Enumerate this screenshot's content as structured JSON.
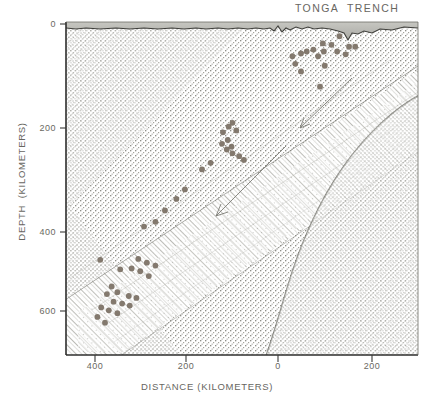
{
  "figure": {
    "title": "TONGA  TRENCH",
    "width": 430,
    "height": 404,
    "kind": "geological-cross-section"
  },
  "axes": {
    "x_label": "DISTANCE (KILOMETERS)",
    "y_label": "DEPTH  (KILOMETERS)",
    "x_ticks": [
      "400",
      "200",
      "0",
      "200"
    ],
    "y_ticks": [
      "0",
      "200",
      "400",
      "600"
    ]
  },
  "colors": {
    "ink": "#3a3a38",
    "label": "#67665f",
    "hypocenter": "#7a6f63",
    "water": "#b9b9b4",
    "stipple": "#8c8c86",
    "slab": "#9a9a94"
  },
  "chart_data": {
    "type": "scatter",
    "title": "TONGA  TRENCH",
    "xlabel": "DISTANCE (KILOMETERS)",
    "ylabel": "DEPTH  (KILOMETERS)",
    "xlim": [
      500,
      -240
    ],
    "ylim": [
      0,
      700
    ],
    "y_inverted": true,
    "grid": false,
    "legend": null,
    "x_tick_values": [
      400,
      200,
      0,
      -200
    ],
    "x_tick_labels": [
      "400",
      "200",
      "0",
      "200"
    ],
    "y_tick_values": [
      0,
      200,
      400,
      600
    ],
    "y_tick_labels": [
      "0",
      "200",
      "400",
      "600"
    ],
    "series": [
      {
        "name": "earthquake hypocenters",
        "marker": "filled-circle",
        "points": [
          {
            "x": -75,
            "y": 30
          },
          {
            "x": -58,
            "y": 48
          },
          {
            "x": -95,
            "y": 52
          },
          {
            "x": -108,
            "y": 52
          },
          {
            "x": -40,
            "y": 45
          },
          {
            "x": -42,
            "y": 62
          },
          {
            "x": -70,
            "y": 62
          },
          {
            "x": -88,
            "y": 68
          },
          {
            "x": -20,
            "y": 58
          },
          {
            "x": -6,
            "y": 62
          },
          {
            "x": -30,
            "y": 72
          },
          {
            "x": 6,
            "y": 66
          },
          {
            "x": 24,
            "y": 72
          },
          {
            "x": 18,
            "y": 88
          },
          {
            "x": 6,
            "y": 104
          },
          {
            "x": -44,
            "y": 92
          },
          {
            "x": -34,
            "y": 136
          },
          {
            "x": 150,
            "y": 212
          },
          {
            "x": 158,
            "y": 220
          },
          {
            "x": 142,
            "y": 228
          },
          {
            "x": 170,
            "y": 232
          },
          {
            "x": 160,
            "y": 248
          },
          {
            "x": 152,
            "y": 262
          },
          {
            "x": 150,
            "y": 276
          },
          {
            "x": 136,
            "y": 282
          },
          {
            "x": 162,
            "y": 268
          },
          {
            "x": 172,
            "y": 256
          },
          {
            "x": 126,
            "y": 290
          },
          {
            "x": 196,
            "y": 296
          },
          {
            "x": 214,
            "y": 310
          },
          {
            "x": 250,
            "y": 352
          },
          {
            "x": 268,
            "y": 372
          },
          {
            "x": 292,
            "y": 396
          },
          {
            "x": 312,
            "y": 420
          },
          {
            "x": 336,
            "y": 430
          },
          {
            "x": 428,
            "y": 500
          },
          {
            "x": 348,
            "y": 498
          },
          {
            "x": 330,
            "y": 506
          },
          {
            "x": 312,
            "y": 512
          },
          {
            "x": 362,
            "y": 518
          },
          {
            "x": 386,
            "y": 520
          },
          {
            "x": 344,
            "y": 524
          },
          {
            "x": 326,
            "y": 534
          },
          {
            "x": 404,
            "y": 556
          },
          {
            "x": 392,
            "y": 568
          },
          {
            "x": 414,
            "y": 572
          },
          {
            "x": 368,
            "y": 576
          },
          {
            "x": 352,
            "y": 580
          },
          {
            "x": 382,
            "y": 592
          },
          {
            "x": 400,
            "y": 588
          },
          {
            "x": 366,
            "y": 596
          },
          {
            "x": 426,
            "y": 600
          },
          {
            "x": 410,
            "y": 606
          },
          {
            "x": 392,
            "y": 612
          },
          {
            "x": 434,
            "y": 620
          },
          {
            "x": 418,
            "y": 632
          }
        ]
      }
    ],
    "annotations": [
      {
        "kind": "seafloor-profile",
        "note": "ocean bottom topography with trench axis notch"
      },
      {
        "kind": "subduction-arrow",
        "note": "arrow indicating downdip slab motion (upper)"
      },
      {
        "kind": "subduction-arrow",
        "note": "arrow indicating downdip slab motion (lower)"
      },
      {
        "kind": "benioff-zone",
        "note": "dipping seismic zone approx 45 degrees"
      },
      {
        "kind": "lithosphere-base",
        "note": "dark curved boundary beneath overriding plate, right side"
      }
    ]
  }
}
